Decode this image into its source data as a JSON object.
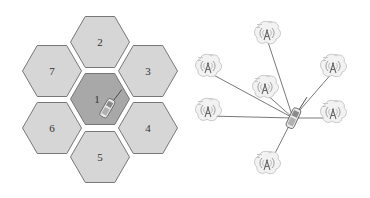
{
  "diagram": {
    "left_panel": {
      "title": "",
      "description": "hexagonal cellular layout",
      "hex_radius": 31,
      "colors": {
        "cell_fill": "#d6d6d6",
        "active_fill": "#a8a8a8",
        "outline": "#6b6b6b",
        "label": "#333333"
      },
      "cells": [
        {
          "id": "1",
          "label": "1",
          "cx": 100,
          "cy": 99,
          "active": true
        },
        {
          "id": "2",
          "label": "2",
          "cx": 100,
          "cy": 42,
          "active": false
        },
        {
          "id": "3",
          "label": "3",
          "cx": 148,
          "cy": 71,
          "active": false
        },
        {
          "id": "4",
          "label": "4",
          "cx": 148,
          "cy": 128,
          "active": false
        },
        {
          "id": "5",
          "label": "5",
          "cx": 100,
          "cy": 157,
          "active": false
        },
        {
          "id": "6",
          "label": "6",
          "cx": 52,
          "cy": 128,
          "active": false
        },
        {
          "id": "7",
          "label": "7",
          "cx": 52,
          "cy": 71,
          "active": false
        }
      ],
      "phone": {
        "x": 107,
        "y": 108,
        "in_cell": "1"
      }
    },
    "right_panel": {
      "description": "mobile phone connected to multiple base stations",
      "phone": {
        "x": 293,
        "y": 118
      },
      "towers": [
        {
          "id": "top",
          "x": 267,
          "y": 33
        },
        {
          "id": "upper-left",
          "x": 208,
          "y": 66
        },
        {
          "id": "middle",
          "x": 265,
          "y": 87
        },
        {
          "id": "upper-right",
          "x": 333,
          "y": 66
        },
        {
          "id": "left",
          "x": 208,
          "y": 110
        },
        {
          "id": "right",
          "x": 333,
          "y": 112
        },
        {
          "id": "bottom",
          "x": 267,
          "y": 163
        }
      ],
      "colors": {
        "link": "#555555",
        "tower_glyph": "#666666",
        "cloud_fill": "#f2f2f2",
        "cloud_outline": "#b5b5b5"
      }
    }
  }
}
